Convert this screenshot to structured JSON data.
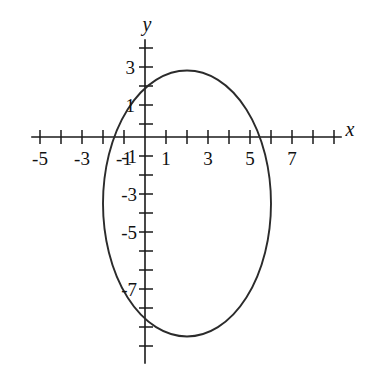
{
  "figure": {
    "title": "",
    "background_color": "#ffffff",
    "ink_color": "#1a1a1a",
    "curve_color": "#2b2b2b",
    "width_px": 369,
    "height_px": 370
  },
  "axes": {
    "x_label": "x",
    "y_label": "y",
    "x_tick_labels": [
      "-5",
      "-3",
      "-1",
      "1",
      "3",
      "5",
      "7"
    ],
    "y_tick_labels": [
      "3",
      "1",
      "-1",
      "-3",
      "-5",
      "-7"
    ],
    "x_label_values": [
      -5,
      -3,
      -1,
      1,
      3,
      5,
      7
    ],
    "y_label_values": [
      3,
      1,
      -1,
      -3,
      -5,
      -7
    ],
    "x_minor_ticks": [
      -6,
      -5,
      -4,
      -3,
      -2,
      -1,
      1,
      2,
      3,
      4,
      5,
      6,
      7,
      8,
      9
    ],
    "y_minor_ticks": [
      5,
      4,
      3,
      2,
      1,
      -1,
      -2,
      -3,
      -4,
      -5,
      -6,
      -7,
      -8,
      -9,
      -10,
      -11
    ],
    "x_axis_range": [
      -6.3,
      9.6
    ],
    "y_axis_range": [
      -11.8,
      5.9
    ],
    "grid": "off",
    "legend": "none"
  },
  "chart_data": {
    "type": "line",
    "title": "",
    "xlabel": "x",
    "ylabel": "y",
    "xlim": [
      -6.3,
      9.6
    ],
    "ylim": [
      -11.8,
      5.9
    ],
    "grid": false,
    "legend_position": "none",
    "series": [
      {
        "name": "ellipse",
        "shape": "ellipse",
        "center": [
          2.0,
          -3.5
        ],
        "semi_axis_x": 4.0,
        "semi_axis_y": 7.0,
        "equation": "((x-2)^2)/16 + ((y+3.5)^2)/49 = 1",
        "x_intercepts": [
          -1.3,
          5.3
        ],
        "y_intercepts": [
          2.4,
          -9.4
        ],
        "extremes": {
          "top": [
            2.0,
            3.5
          ],
          "bottom": [
            2.0,
            -10.5
          ],
          "left": [
            -2.0,
            -3.5
          ],
          "right": [
            6.0,
            -3.5
          ]
        }
      }
    ]
  }
}
